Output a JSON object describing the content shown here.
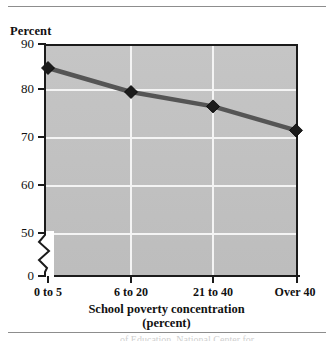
{
  "figure": {
    "y_axis_title": "Percent",
    "x_axis_title_line1": "School poverty concentration",
    "x_axis_title_line2": "(percent)",
    "source_note": "of Education, National Center for"
  },
  "colors": {
    "plot_background": "#c3c3c3",
    "gridline": "#f4f4f4",
    "line": "#555555",
    "marker_fill": "#1b1b1b",
    "axis": "#1b1b1b",
    "rule": "#8d8d8d"
  },
  "chart_data": {
    "type": "line",
    "title": "",
    "xlabel": "School poverty concentration (percent)",
    "ylabel": "Percent",
    "categories": [
      "0 to 5",
      "6 to 20",
      "21 to 40",
      "Over 40"
    ],
    "values": [
      85,
      80,
      77,
      72
    ],
    "ylim": [
      0,
      90
    ],
    "yticks": [
      90,
      80,
      70,
      60,
      50,
      0
    ],
    "ytick_labels": [
      "90",
      "80",
      "70",
      "60",
      "50",
      "0"
    ],
    "gridlines": {
      "horizontal": [
        80,
        70,
        60,
        50
      ],
      "vertical": [
        "6 to 20",
        "21 to 40"
      ]
    },
    "y_axis_break": true,
    "y_axis_break_between": [
      0,
      50
    ],
    "grid": true,
    "legend": "none",
    "marker": "diamond"
  }
}
